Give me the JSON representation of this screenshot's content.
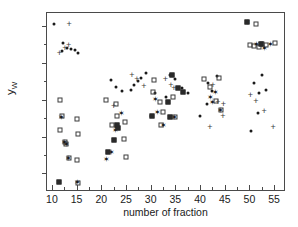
{
  "chart_data": {
    "type": "scatter",
    "title": "",
    "xlabel": "number of fraction",
    "ylabel": "yW",
    "ylabel_base": "y",
    "ylabel_sub": "W",
    "xlim": [
      9,
      57
    ],
    "ylim": [
      0.255,
      0.735
    ],
    "xticks": [
      10,
      15,
      20,
      25,
      30,
      35,
      40,
      45,
      50,
      55
    ],
    "xtick_labels": [
      "10",
      "15",
      "20",
      "25",
      "30",
      "35",
      "40",
      "45",
      "50",
      "55"
    ],
    "xminor_ticks": [
      12.5,
      17.5,
      22.5,
      27.5,
      32.5,
      37.5,
      42.5,
      47.5,
      52.5
    ],
    "yticks": [
      0.3,
      0.4,
      0.5,
      0.6,
      0.7
    ],
    "ytick_labels": [
      "0,3",
      "0,4",
      "0,5",
      "0,6",
      "0,7"
    ],
    "yminor_ticks": [
      0.35,
      0.45,
      0.55,
      0.65
    ],
    "grid": false,
    "legend": false,
    "decimal_separator": ",",
    "colors": {
      "axis": "#4a4a4a",
      "text": "#1a1a1a",
      "marker_dot": "#1a1a1a",
      "marker_square": "#3d3d3d",
      "marker_plus": "#3d3d3d",
      "marker_star": "#1a1a1a"
    },
    "series": [
      {
        "name": "filled circle",
        "marker": "dot",
        "points": [
          [
            10.4,
            0.706
          ],
          [
            12.3,
            0.655
          ],
          [
            13.0,
            0.641
          ],
          [
            13.8,
            0.637
          ],
          [
            14.6,
            0.634
          ],
          [
            15.3,
            0.626
          ],
          [
            12.0,
            0.631
          ],
          [
            29.1,
            0.573
          ],
          [
            28.0,
            0.559
          ],
          [
            27.4,
            0.55
          ],
          [
            26.6,
            0.54
          ],
          [
            26.0,
            0.527
          ],
          [
            22.0,
            0.553
          ],
          [
            23.0,
            0.533
          ],
          [
            24.1,
            0.523
          ],
          [
            30.8,
            0.517
          ],
          [
            34.0,
            0.568
          ],
          [
            35.0,
            0.555
          ],
          [
            36.3,
            0.532
          ],
          [
            37.5,
            0.519
          ],
          [
            33.1,
            0.507
          ],
          [
            41.7,
            0.545
          ],
          [
            43.5,
            0.563
          ],
          [
            42.5,
            0.524
          ],
          [
            41.5,
            0.487
          ],
          [
            40.0,
            0.457
          ],
          [
            50.9,
            0.545
          ],
          [
            52.6,
            0.566
          ],
          [
            52.0,
            0.519
          ],
          [
            53.3,
            0.527
          ],
          [
            51.7,
            0.465
          ],
          [
            50.4,
            0.415
          ],
          [
            30.0,
            0.456
          ]
        ]
      },
      {
        "name": "plus",
        "marker": "plus",
        "points": [
          [
            13.5,
            0.705
          ],
          [
            11.5,
            0.627
          ],
          [
            12.6,
            0.639
          ],
          [
            13.4,
            0.648
          ],
          [
            26.2,
            0.568
          ],
          [
            27.2,
            0.556
          ],
          [
            28.6,
            0.536
          ],
          [
            33.0,
            0.555
          ],
          [
            34.1,
            0.54
          ],
          [
            34.7,
            0.532
          ],
          [
            42.6,
            0.54
          ],
          [
            43.6,
            0.494
          ],
          [
            44.7,
            0.489
          ],
          [
            44.6,
            0.455
          ],
          [
            50.2,
            0.512
          ],
          [
            51.3,
            0.497
          ],
          [
            53.0,
            0.47
          ],
          [
            54.8,
            0.425
          ],
          [
            42.0,
            0.425
          ],
          [
            22.5,
            0.482
          ]
        ]
      },
      {
        "name": "open square",
        "marker": "square",
        "points": [
          [
            11.6,
            0.499
          ],
          [
            12.0,
            0.455
          ],
          [
            11.7,
            0.417
          ],
          [
            12.6,
            0.386
          ],
          [
            12.8,
            0.381
          ],
          [
            13.4,
            0.342
          ],
          [
            15.0,
            0.447
          ],
          [
            15.2,
            0.408
          ],
          [
            15.1,
            0.337
          ],
          [
            15.3,
            0.273
          ],
          [
            21.0,
            0.5
          ],
          [
            22.9,
            0.489
          ],
          [
            23.1,
            0.455
          ],
          [
            24.8,
            0.439
          ],
          [
            24.6,
            0.393
          ],
          [
            24.9,
            0.345
          ],
          [
            22.2,
            0.43
          ],
          [
            30.6,
            0.554
          ],
          [
            30.5,
            0.52
          ],
          [
            31.9,
            0.494
          ],
          [
            32.5,
            0.466
          ],
          [
            34.5,
            0.507
          ],
          [
            35.0,
            0.452
          ],
          [
            32.0,
            0.43
          ],
          [
            40.8,
            0.556
          ],
          [
            42.0,
            0.535
          ],
          [
            43.8,
            0.56
          ],
          [
            43.3,
            0.496
          ],
          [
            44.3,
            0.473
          ],
          [
            51.4,
            0.705
          ],
          [
            50.2,
            0.648
          ],
          [
            51.0,
            0.646
          ],
          [
            52.0,
            0.644
          ],
          [
            52.6,
            0.65
          ],
          [
            53.4,
            0.647
          ],
          [
            55.2,
            0.653
          ]
        ]
      },
      {
        "name": "star overlay",
        "marker": "star",
        "points": [
          [
            12.0,
            0.453
          ],
          [
            12.6,
            0.385
          ],
          [
            12.9,
            0.38
          ],
          [
            13.4,
            0.341
          ],
          [
            15.1,
            0.276
          ],
          [
            21.0,
            0.34
          ],
          [
            22.8,
            0.419
          ],
          [
            23.0,
            0.427
          ],
          [
            22.0,
            0.358
          ],
          [
            31.0,
            0.503
          ],
          [
            31.4,
            0.466
          ],
          [
            32.6,
            0.43
          ],
          [
            34.8,
            0.453
          ],
          [
            42.1,
            0.507
          ],
          [
            42.6,
            0.494
          ],
          [
            43.1,
            0.52
          ],
          [
            44.2,
            0.473
          ],
          [
            49.7,
            0.71
          ],
          [
            51.5,
            0.65
          ],
          [
            53.0,
            0.64
          ],
          [
            54.3,
            0.652
          ],
          [
            24.0,
            0.463
          ]
        ]
      },
      {
        "name": "filled square",
        "marker": "squarefill",
        "points": [
          [
            11.5,
            0.277
          ],
          [
            21.4,
            0.357
          ],
          [
            22.6,
            0.391
          ],
          [
            23.4,
            0.424
          ],
          [
            23.1,
            0.431
          ],
          [
            30.2,
            0.455
          ],
          [
            34.4,
            0.568
          ],
          [
            35.6,
            0.531
          ],
          [
            36.5,
            0.52
          ],
          [
            33.5,
            0.494
          ],
          [
            34.0,
            0.452
          ],
          [
            49.5,
            0.71
          ],
          [
            52.4,
            0.65
          ]
        ]
      }
    ]
  }
}
